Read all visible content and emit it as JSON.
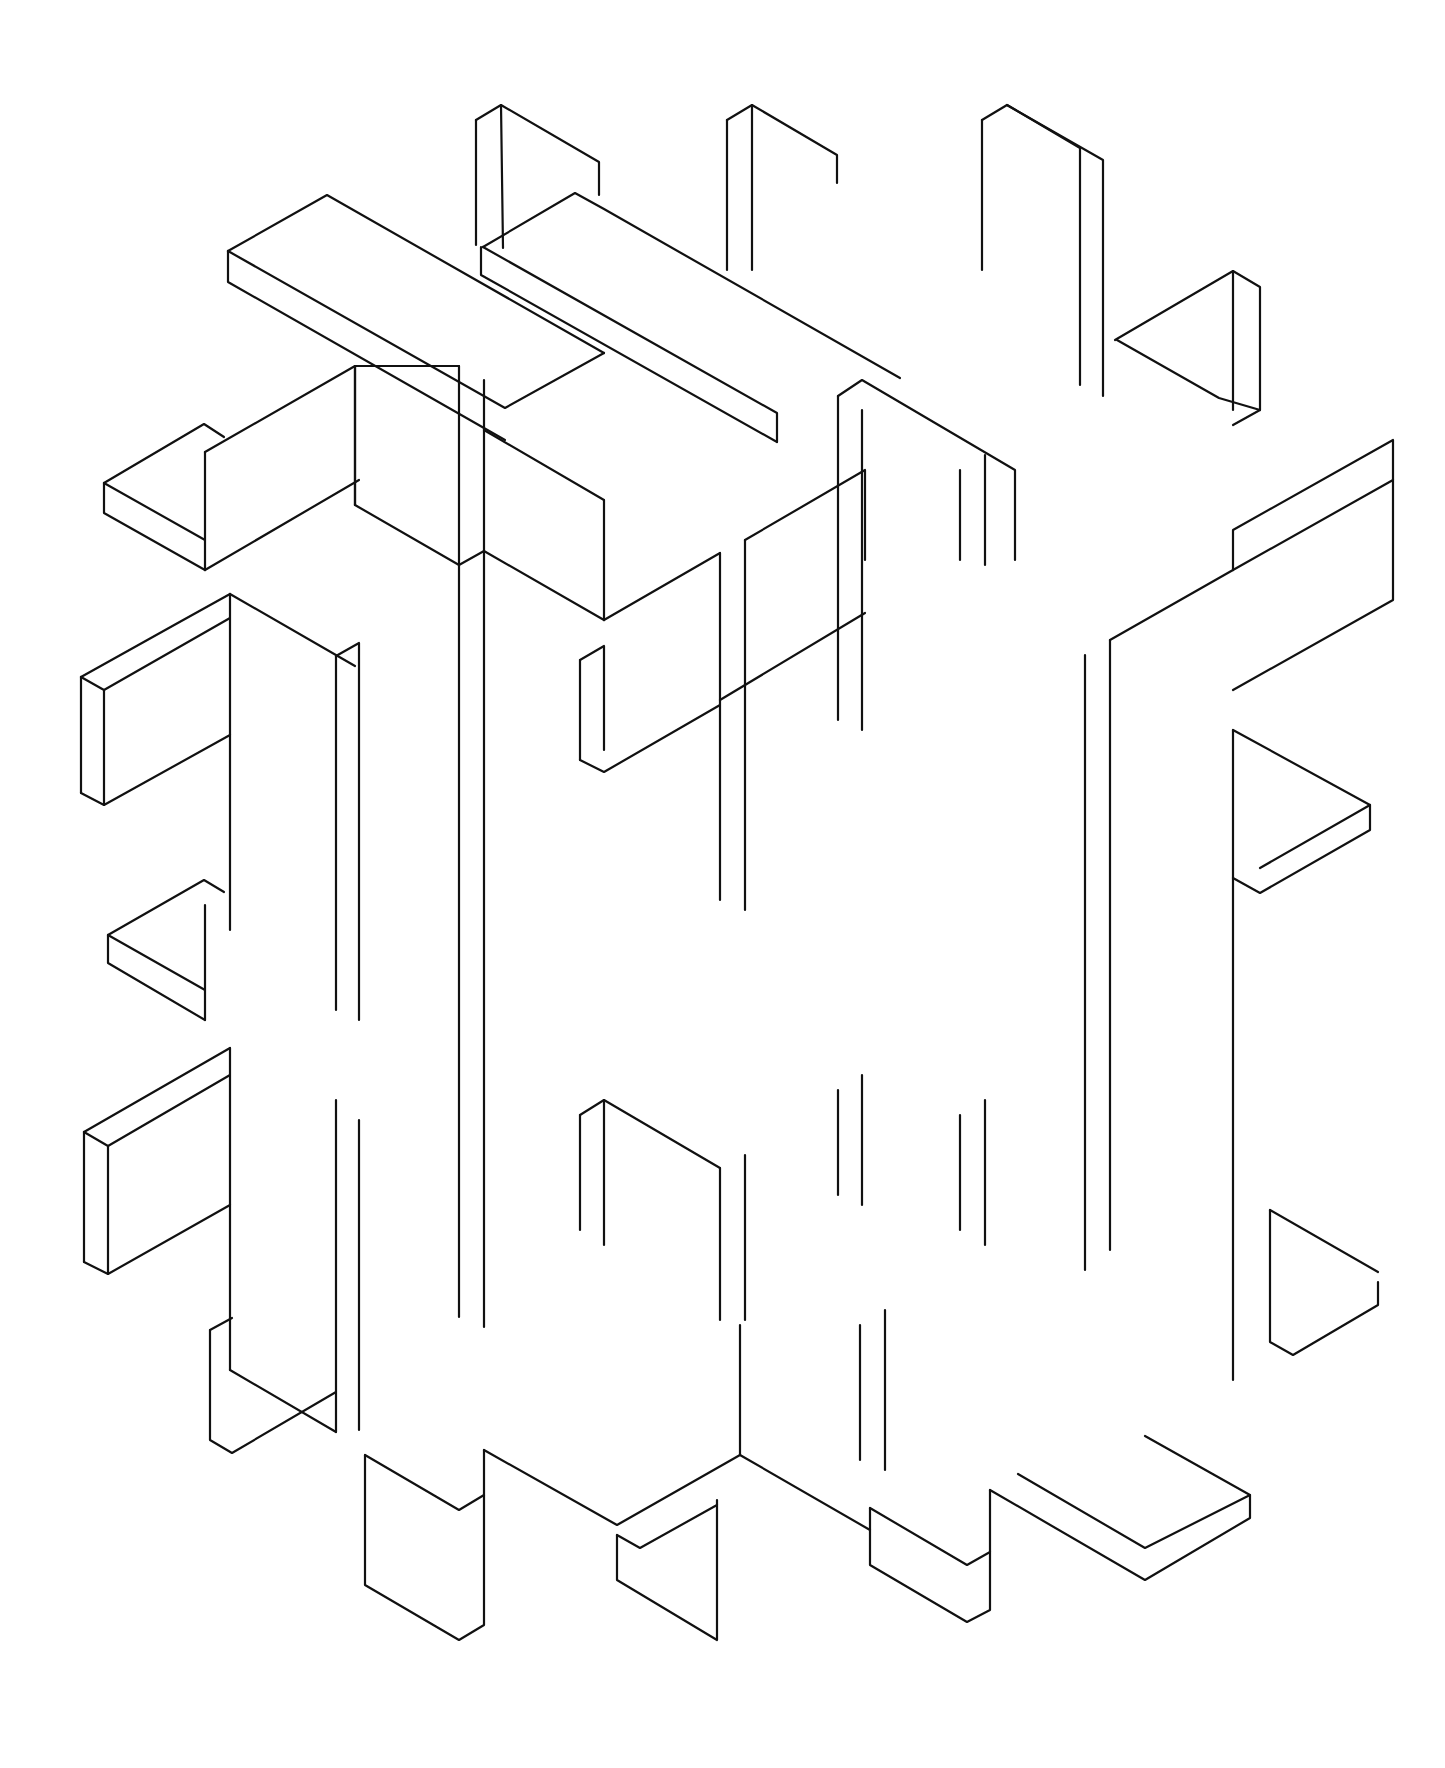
{
  "artwork": {
    "title": "Isometric interlocking slab lattice (line drawing)",
    "background": "#ffffff",
    "ink": "#111111",
    "stroke_width": 2.2,
    "width": 1445,
    "height": 1768,
    "polylines": [
      [
        [
          228,
          251
        ],
        [
          327,
          195
        ],
        [
          604,
          353
        ]
      ],
      [
        [
          228,
          251
        ],
        [
          228,
          282
        ],
        [
          505,
          440
        ]
      ],
      [
        [
          228,
          251
        ],
        [
          505,
          408
        ],
        [
          604,
          353
        ]
      ],
      [
        [
          476,
          120
        ],
        [
          476,
          245
        ]
      ],
      [
        [
          476,
          120
        ],
        [
          501,
          105
        ],
        [
          599,
          162
        ],
        [
          599,
          195
        ]
      ],
      [
        [
          501,
          105
        ],
        [
          503,
          248
        ]
      ],
      [
        [
          483,
          247
        ],
        [
          575,
          193
        ],
        [
          604,
          209
        ],
        [
          900,
          378
        ]
      ],
      [
        [
          481,
          247
        ],
        [
          481,
          275
        ],
        [
          777,
          442
        ]
      ],
      [
        [
          483,
          247
        ],
        [
          777,
          413
        ],
        [
          777,
          442
        ]
      ],
      [
        [
          727,
          120
        ],
        [
          752,
          105
        ],
        [
          837,
          155
        ],
        [
          837,
          183
        ]
      ],
      [
        [
          727,
          120
        ],
        [
          727,
          270
        ]
      ],
      [
        [
          752,
          105
        ],
        [
          752,
          270
        ]
      ],
      [
        [
          982,
          120
        ],
        [
          1007,
          105
        ],
        [
          1103,
          160
        ],
        [
          1103,
          396
        ]
      ],
      [
        [
          982,
          120
        ],
        [
          982,
          270
        ]
      ],
      [
        [
          1007,
          105
        ],
        [
          1080,
          148
        ],
        [
          1080,
          385
        ]
      ],
      [
        [
          1115,
          340
        ],
        [
          1233,
          271
        ],
        [
          1260,
          287
        ],
        [
          1260,
          410
        ],
        [
          1233,
          425
        ]
      ],
      [
        [
          1233,
          271
        ],
        [
          1233,
          410
        ]
      ],
      [
        [
          1117,
          340
        ],
        [
          1219,
          398
        ],
        [
          1260,
          410
        ]
      ],
      [
        [
          104,
          483
        ],
        [
          204,
          424
        ],
        [
          224,
          437
        ]
      ],
      [
        [
          104,
          483
        ],
        [
          104,
          513
        ],
        [
          205,
          570
        ]
      ],
      [
        [
          104,
          483
        ],
        [
          205,
          540
        ]
      ],
      [
        [
          205,
          452
        ],
        [
          205,
          570
        ]
      ],
      [
        [
          205,
          452
        ],
        [
          355,
          366
        ],
        [
          459,
          366
        ]
      ],
      [
        [
          355,
          366
        ],
        [
          355,
          505
        ]
      ],
      [
        [
          205,
          570
        ],
        [
          359,
          480
        ]
      ],
      [
        [
          81,
          677
        ],
        [
          81,
          793
        ]
      ],
      [
        [
          81,
          677
        ],
        [
          176,
          624
        ],
        [
          230,
          594
        ]
      ],
      [
        [
          81,
          677
        ],
        [
          104,
          690
        ],
        [
          104,
          805
        ]
      ],
      [
        [
          104,
          690
        ],
        [
          230,
          618
        ]
      ],
      [
        [
          81,
          793
        ],
        [
          104,
          805
        ],
        [
          230,
          735
        ]
      ],
      [
        [
          230,
          594
        ],
        [
          230,
          930
        ]
      ],
      [
        [
          230,
          594
        ],
        [
          355,
          666
        ]
      ],
      [
        [
          336,
          656
        ],
        [
          336,
          1010
        ]
      ],
      [
        [
          336,
          656
        ],
        [
          359,
          643
        ],
        [
          359,
          1020
        ]
      ],
      [
        [
          355,
          366
        ],
        [
          355,
          505
        ]
      ],
      [
        [
          459,
          366
        ],
        [
          459,
          1317
        ]
      ],
      [
        [
          484,
          380
        ],
        [
          484,
          1327
        ]
      ],
      [
        [
          355,
          505
        ],
        [
          459,
          565
        ],
        [
          484,
          551
        ],
        [
          604,
          620
        ],
        [
          604,
          500
        ]
      ],
      [
        [
          604,
          500
        ],
        [
          484,
          430
        ]
      ],
      [
        [
          604,
          620
        ],
        [
          720,
          553
        ]
      ],
      [
        [
          580,
          660
        ],
        [
          580,
          760
        ]
      ],
      [
        [
          580,
          660
        ],
        [
          604,
          646
        ],
        [
          604,
          750
        ]
      ],
      [
        [
          580,
          760
        ],
        [
          604,
          772
        ],
        [
          720,
          705
        ]
      ],
      [
        [
          720,
          553
        ],
        [
          720,
          900
        ]
      ],
      [
        [
          745,
          540
        ],
        [
          745,
          910
        ]
      ],
      [
        [
          745,
          540
        ],
        [
          865,
          470
        ],
        [
          865,
          560
        ]
      ],
      [
        [
          720,
          700
        ],
        [
          865,
          613
        ]
      ],
      [
        [
          838,
          396
        ],
        [
          838,
          720
        ]
      ],
      [
        [
          862,
          410
        ],
        [
          862,
          730
        ]
      ],
      [
        [
          838,
          396
        ],
        [
          862,
          380
        ],
        [
          1015,
          470
        ],
        [
          1015,
          560
        ]
      ],
      [
        [
          960,
          470
        ],
        [
          960,
          560
        ]
      ],
      [
        [
          985,
          455
        ],
        [
          985,
          565
        ]
      ],
      [
        [
          1085,
          655
        ],
        [
          1085,
          1270
        ]
      ],
      [
        [
          1110,
          640
        ],
        [
          1110,
          1250
        ]
      ],
      [
        [
          1110,
          640
        ],
        [
          1233,
          570
        ],
        [
          1233,
          530
        ],
        [
          1393,
          440
        ],
        [
          1393,
          600
        ],
        [
          1233,
          690
        ]
      ],
      [
        [
          1233,
          570
        ],
        [
          1393,
          480
        ]
      ],
      [
        [
          1233,
          730
        ],
        [
          1233,
          1380
        ]
      ],
      [
        [
          1233,
          730
        ],
        [
          1370,
          805
        ],
        [
          1370,
          830
        ],
        [
          1260,
          893
        ],
        [
          1233,
          878
        ]
      ],
      [
        [
          1260,
          868
        ],
        [
          1370,
          805
        ]
      ],
      [
        [
          108,
          935
        ],
        [
          204,
          880
        ],
        [
          224,
          892
        ]
      ],
      [
        [
          108,
          935
        ],
        [
          108,
          963
        ],
        [
          205,
          1020
        ]
      ],
      [
        [
          108,
          935
        ],
        [
          205,
          990
        ]
      ],
      [
        [
          205,
          905
        ],
        [
          205,
          1020
        ]
      ],
      [
        [
          84,
          1132
        ],
        [
          84,
          1262
        ]
      ],
      [
        [
          84,
          1132
        ],
        [
          230,
          1048
        ]
      ],
      [
        [
          84,
          1132
        ],
        [
          108,
          1146
        ],
        [
          108,
          1274
        ]
      ],
      [
        [
          108,
          1146
        ],
        [
          230,
          1075
        ]
      ],
      [
        [
          84,
          1262
        ],
        [
          108,
          1274
        ],
        [
          230,
          1205
        ]
      ],
      [
        [
          230,
          1048
        ],
        [
          230,
          1370
        ]
      ],
      [
        [
          230,
          1370
        ],
        [
          336,
          1432
        ]
      ],
      [
        [
          336,
          1100
        ],
        [
          336,
          1432
        ]
      ],
      [
        [
          359,
          1120
        ],
        [
          359,
          1430
        ]
      ],
      [
        [
          210,
          1330
        ],
        [
          210,
          1440
        ],
        [
          232,
          1453
        ],
        [
          336,
          1392
        ]
      ],
      [
        [
          210,
          1330
        ],
        [
          232,
          1318
        ]
      ],
      [
        [
          365,
          1455
        ],
        [
          365,
          1585
        ],
        [
          459,
          1640
        ],
        [
          484,
          1625
        ],
        [
          484,
          1450
        ]
      ],
      [
        [
          365,
          1455
        ],
        [
          459,
          1510
        ],
        [
          484,
          1495
        ]
      ],
      [
        [
          617,
          1535
        ],
        [
          617,
          1580
        ],
        [
          717,
          1640
        ],
        [
          717,
          1500
        ]
      ],
      [
        [
          617,
          1535
        ],
        [
          640,
          1548
        ],
        [
          717,
          1505
        ]
      ],
      [
        [
          484,
          1450
        ],
        [
          617,
          1525
        ],
        [
          740,
          1455
        ]
      ],
      [
        [
          740,
          1455
        ],
        [
          740,
          1325
        ]
      ],
      [
        [
          870,
          1508
        ],
        [
          870,
          1565
        ],
        [
          967,
          1622
        ],
        [
          990,
          1610
        ],
        [
          990,
          1490
        ]
      ],
      [
        [
          870,
          1508
        ],
        [
          967,
          1565
        ],
        [
          990,
          1552
        ]
      ],
      [
        [
          990,
          1490
        ],
        [
          1145,
          1580
        ],
        [
          1250,
          1518
        ],
        [
          1250,
          1495
        ]
      ],
      [
        [
          1018,
          1474
        ],
        [
          1145,
          1548
        ],
        [
          1250,
          1495
        ],
        [
          1145,
          1436
        ]
      ],
      [
        [
          740,
          1455
        ],
        [
          870,
          1530
        ]
      ],
      [
        [
          860,
          1325
        ],
        [
          860,
          1460
        ]
      ],
      [
        [
          885,
          1310
        ],
        [
          885,
          1470
        ]
      ],
      [
        [
          1270,
          1210
        ],
        [
          1270,
          1342
        ],
        [
          1293,
          1355
        ],
        [
          1378,
          1305
        ],
        [
          1378,
          1282
        ]
      ],
      [
        [
          1270,
          1210
        ],
        [
          1378,
          1272
        ]
      ],
      [
        [
          580,
          1115
        ],
        [
          580,
          1230
        ]
      ],
      [
        [
          604,
          1100
        ],
        [
          604,
          1245
        ]
      ],
      [
        [
          580,
          1115
        ],
        [
          604,
          1100
        ],
        [
          720,
          1168
        ]
      ],
      [
        [
          720,
          1168
        ],
        [
          720,
          1320
        ]
      ],
      [
        [
          745,
          1155
        ],
        [
          745,
          1320
        ]
      ],
      [
        [
          838,
          1090
        ],
        [
          838,
          1195
        ]
      ],
      [
        [
          862,
          1075
        ],
        [
          862,
          1205
        ]
      ],
      [
        [
          960,
          1115
        ],
        [
          960,
          1230
        ]
      ],
      [
        [
          985,
          1100
        ],
        [
          985,
          1245
        ]
      ]
    ]
  }
}
